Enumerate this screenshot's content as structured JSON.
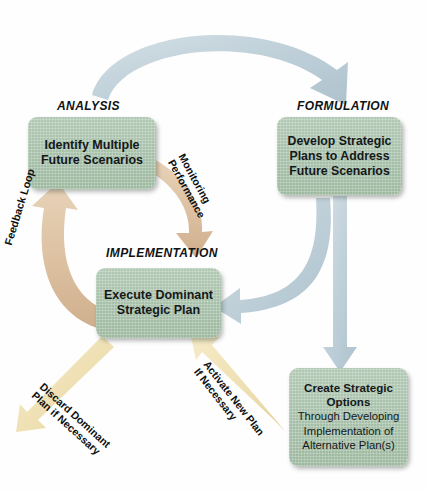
{
  "diagram": {
    "type": "cycle-flow-diagram",
    "colors": {
      "box_fill": "#a6bfa9",
      "blue_arrow": "#c3d2da",
      "tan_arrow": "#dcc0a0",
      "pale_yellow_arrow": "#f0dfb4",
      "text": "#101314",
      "background": "#ffffff"
    },
    "stages": [
      {
        "id": "analysis",
        "caption": "ANALYSIS",
        "box_text": "Identify Multiple\nFuture Scenarios",
        "line1": "Identify Multiple",
        "line2": "Future Scenarios"
      },
      {
        "id": "formulation",
        "caption": "FORMULATION",
        "box_text": "Develop Strategic\nPlans to Address\nFuture Scenarios",
        "line1": "Develop Strategic",
        "line2": "Plans to Address",
        "line3": "Future Scenarios"
      },
      {
        "id": "implementation",
        "caption": "IMPLEMENTATION",
        "box_text": "Execute Dominant\nStrategic Plan",
        "line1": "Execute Dominant",
        "line2": "Strategic Plan"
      },
      {
        "id": "options",
        "caption": "",
        "heading_line1": "Create Strategic",
        "heading_line2": "Options",
        "sub_line1": "Through Developing",
        "sub_line2": "Implementation of",
        "sub_line3": "Alternative Plan(s)"
      }
    ],
    "arrow_labels": [
      {
        "id": "feedback-loop",
        "text": "Feedback Loop",
        "line1": "Feedback Loop",
        "color": "#dcc0a0"
      },
      {
        "id": "monitoring-performance",
        "line1": "Monitoring",
        "line2": "Performance",
        "color": "#dcc0a0"
      },
      {
        "id": "discard-dominant-plan",
        "line1": "Discard Dominant",
        "line2": "Plan if Necessary",
        "color": "#f0dfb4"
      },
      {
        "id": "activate-new-plan",
        "line1": "Activate New Plan",
        "line2": "If Necessary",
        "color": "#f0dfb4"
      }
    ],
    "arrows": [
      {
        "id": "analysis-to-formulation",
        "from": "analysis",
        "to": "formulation",
        "color": "#c3d2da",
        "style": "curved"
      },
      {
        "id": "formulation-to-options",
        "from": "formulation",
        "to": "options",
        "color": "#c3d2da",
        "style": "straight-down"
      },
      {
        "id": "formulation-to-implementation",
        "from": "formulation",
        "to": "implementation",
        "color": "#c3d2da",
        "style": "curved"
      },
      {
        "id": "implementation-to-analysis",
        "from": "implementation",
        "to": "analysis",
        "color": "#dcc0a0",
        "style": "curved"
      },
      {
        "id": "analysis-to-implementation",
        "from": "analysis",
        "to": "implementation",
        "color": "#dcc0a0",
        "style": "curved"
      },
      {
        "id": "implementation-discard",
        "from": "implementation",
        "to": "discard",
        "color": "#f0dfb4",
        "style": "straight-diagonal"
      },
      {
        "id": "options-to-implementation",
        "from": "options",
        "to": "implementation",
        "color": "#f0dfb4",
        "style": "straight-diagonal"
      }
    ]
  }
}
